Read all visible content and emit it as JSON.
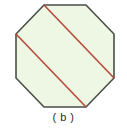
{
  "figure": {
    "label": "( b )",
    "shape_name": "regular-octagon",
    "description_text": "( b )"
  },
  "colors": {
    "background": "#ffffff",
    "octagon_fill": "#eef6e4",
    "octagon_stroke": "#4a4f48",
    "diagonal_stroke": "#b74b3a",
    "caption_text": "#2b2b2b"
  },
  "geometry": {
    "octagon_points": "44,5 86,5 114,34 114,78 86,107 44,107 16,78 16,34",
    "octagon_stroke_width": "1.6",
    "diagonals": [
      {
        "name": "upper-diagonal",
        "x1": 44,
        "y1": 5,
        "x2": 114,
        "y2": 78
      },
      {
        "name": "lower-diagonal",
        "x1": 16,
        "y1": 34,
        "x2": 86,
        "y2": 107
      }
    ],
    "diagonal_stroke_width": "1.6"
  },
  "chart_data": {
    "type": "diagram",
    "title": "( b )",
    "shape": "regular octagon",
    "vertices": [
      [
        44,
        5
      ],
      [
        86,
        5
      ],
      [
        114,
        34
      ],
      [
        114,
        78
      ],
      [
        86,
        107
      ],
      [
        44,
        107
      ],
      [
        16,
        78
      ],
      [
        16,
        34
      ]
    ],
    "vertex_count": 8,
    "segments": [
      {
        "label": "upper diagonal",
        "from_vertex": 0,
        "to_vertex": 3,
        "color": "#b74b3a"
      },
      {
        "label": "lower diagonal",
        "from_vertex": 7,
        "to_vertex": 4,
        "color": "#b74b3a"
      }
    ],
    "annotations": [
      "( b )"
    ]
  }
}
